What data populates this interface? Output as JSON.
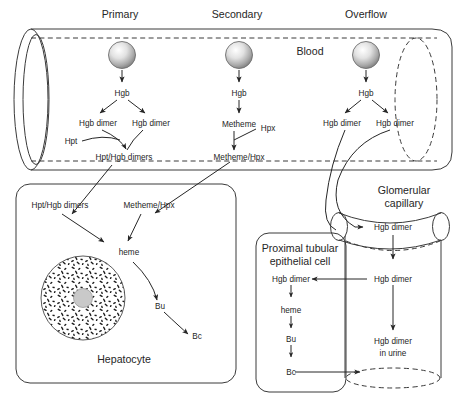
{
  "figure": {
    "type": "biomedical-pathway-diagram"
  },
  "column_headers": [
    {
      "label": "Primary",
      "x": 120
    },
    {
      "label": "Secondary",
      "x": 237
    },
    {
      "label": "Overflow",
      "x": 366
    }
  ],
  "blood": {
    "label": "Blood",
    "compartment": "blood-vessel"
  },
  "pathways": {
    "primary": {
      "source": "rbc-sphere",
      "steps": [
        "Hgb",
        "Hgb dimer",
        "Hgb dimer",
        "Hpt",
        "Hpt/Hgb dimers"
      ],
      "hgb": "Hgb",
      "dimer_left": "Hgb dimer",
      "dimer_right": "Hgb dimer",
      "binder": "Hpt",
      "complex": "Hpt/Hgb dimers"
    },
    "secondary": {
      "source": "rbc-sphere",
      "hgb": "Hgb",
      "metheme": "Metheme",
      "binder": "Hpx",
      "complex": "Metheme/Hpx"
    },
    "overflow": {
      "source": "rbc-sphere",
      "hgb": "Hgb",
      "dimer_left": "Hgb dimer",
      "dimer_right": "Hgb dimer"
    }
  },
  "hepatocyte": {
    "title": "Hepatocyte",
    "inputs": [
      "Hpt/Hgb dimers",
      "Metheme/Hpx"
    ],
    "input_left": "Hpt/Hgb dimers",
    "input_right": "Metheme/Hpx",
    "heme": "heme",
    "bu": "Bu",
    "bc": "Bc",
    "organelle": "nucleus"
  },
  "kidney": {
    "glomerular_capillary": {
      "label_line1": "Glomerular",
      "label_line2": "capillary",
      "dimer": "Hgb dimer"
    },
    "tubule": {
      "dimer": "Hgb dimer",
      "urine_line1": "Hgb dimer",
      "urine_line2": "in urine"
    },
    "proximal_cell": {
      "title_line1": "Proximal tubular",
      "title_line2": "epithelial cell",
      "dimer": "Hgb dimer",
      "heme": "heme",
      "bu": "Bu",
      "bc": "Bc"
    }
  },
  "colors": {
    "stroke": "#3a3a3a",
    "text": "#262626",
    "sphere_light": "#ffffff",
    "sphere_dark": "#8d8d8d",
    "nucleus_center": "#c9c9c9",
    "background": "#ffffff"
  }
}
